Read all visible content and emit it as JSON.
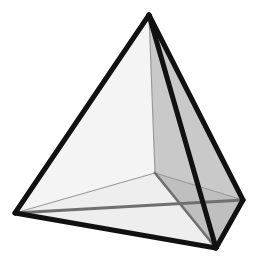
{
  "figure": {
    "shape_name": "tetrahedron",
    "background_color": "#ffffff",
    "canvas": {
      "width": 259,
      "height": 272
    }
  },
  "geometry": {
    "vertices": [
      {
        "name": "apex",
        "label": "A",
        "x": 149,
        "y": 15,
        "hidden": false
      },
      {
        "name": "left-front",
        "label": "B",
        "x": 15,
        "y": 213,
        "hidden": false
      },
      {
        "name": "bottom-front",
        "label": "C",
        "x": 216,
        "y": 248,
        "hidden": false
      },
      {
        "name": "right-back",
        "label": "D",
        "x": 243,
        "y": 200,
        "hidden": false
      },
      {
        "name": "inner-back",
        "label": "E",
        "x": 155,
        "y": 173,
        "hidden": true
      }
    ],
    "outline_path": "M149,15 L15,213 L216,248 L243,200 Z",
    "edges": [
      {
        "name": "edge-apex-left",
        "from": "apex",
        "to": "left-front",
        "style": "visible-thick",
        "path": "M149,15 L15,213"
      },
      {
        "name": "edge-apex-bottom",
        "from": "apex",
        "to": "bottom-front",
        "style": "visible-thick",
        "path": "M149,15 L216,248"
      },
      {
        "name": "edge-apex-right",
        "from": "apex",
        "to": "right-back",
        "style": "visible-thick",
        "path": "M149,15 L243,200"
      },
      {
        "name": "edge-left-bottom",
        "from": "left-front",
        "to": "bottom-front",
        "style": "visible-thick",
        "path": "M15,213 L216,248"
      },
      {
        "name": "edge-bottom-right",
        "from": "bottom-front",
        "to": "right-back",
        "style": "visible-thick",
        "path": "M216,248 L243,200"
      },
      {
        "name": "edge-left-right",
        "from": "left-front",
        "to": "right-back",
        "style": "hidden-medium",
        "path": "M15,213 L243,200"
      },
      {
        "name": "edge-apex-inner",
        "from": "apex",
        "to": "inner-back",
        "style": "hidden-thin",
        "path": "M149,15 L155,173"
      },
      {
        "name": "edge-left-inner",
        "from": "left-front",
        "to": "inner-back",
        "style": "hidden-thin",
        "path": "M15,213 L155,173"
      },
      {
        "name": "edge-inner-right",
        "from": "inner-back",
        "to": "right-back",
        "style": "hidden-thin",
        "path": "M155,173 L243,200"
      },
      {
        "name": "edge-inner-bottom",
        "from": "inner-back",
        "to": "bottom-front",
        "style": "hidden-medium",
        "path": "M155,173 L216,248"
      }
    ],
    "faces": [
      {
        "name": "face-apex-left-inner",
        "fill": "#f4f4f4",
        "path": "M149,15 L15,213 L155,173 Z"
      },
      {
        "name": "face-apex-inner-right",
        "fill": "#c9c9c9",
        "path": "M149,15 L155,173 L243,200 Z"
      },
      {
        "name": "face-inner-right-bottom",
        "fill": "#bfbfbf",
        "path": "M155,173 L243,200 L216,248 Z"
      },
      {
        "name": "face-left-inner-bottom",
        "fill": "#eeeeee",
        "path": "M15,213 L155,173 L216,248 Z"
      },
      {
        "name": "face-apex-left-bottom",
        "fill": "#fafafa",
        "path": "M149,15 L15,213 L216,248 Z"
      },
      {
        "name": "face-apex-bottom-right",
        "fill": "#e6e6e6",
        "path": "M149,15 L216,248 L243,200 Z"
      }
    ]
  },
  "style": {
    "visible_edge_color": "#111111",
    "visible_edge_width": "5",
    "hidden_medium_color": "#6f6f6f",
    "hidden_medium_width": "3",
    "hidden_thin_color": "#9a9a9a",
    "hidden_thin_width": "1.2",
    "face_light": "#f5f5f5",
    "face_mid": "#d8d8d8",
    "face_dark": "#c3c3c3"
  }
}
